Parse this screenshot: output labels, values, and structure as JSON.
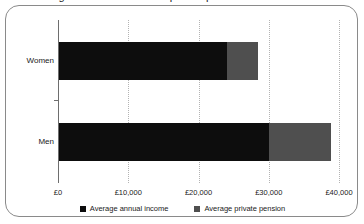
{
  "chart_data": {
    "type": "bar",
    "orientation": "horizontal",
    "stacked": true,
    "title": "",
    "xlabel": "",
    "ylabel": "",
    "categories": [
      "Women",
      "Men"
    ],
    "series": [
      {
        "name": "Average annual income",
        "color": "#0d0d0d",
        "values": [
          24000,
          30000
        ]
      },
      {
        "name": "Average private pension",
        "color": "#4f4f4f",
        "values": [
          4500,
          8800
        ]
      }
    ],
    "xlim": [
      0,
      40000
    ],
    "xticks": [
      0,
      10000,
      20000,
      30000,
      40000
    ],
    "xtick_labels": [
      "£0",
      "£10,000",
      "£20,000",
      "£30,000",
      "£40,000"
    ],
    "grid": true,
    "grid_axis": "x",
    "grid_style": "dotted",
    "legend_position": "bottom"
  },
  "legend": {
    "items": [
      {
        "label": "Average annual income",
        "color": "#0d0d0d",
        "swatch_name": "legend-swatch-income"
      },
      {
        "label": "Average private pension",
        "color": "#4f4f4f",
        "swatch_name": "legend-swatch-pension"
      }
    ]
  },
  "title_remnant": "Average annual income and private pension"
}
